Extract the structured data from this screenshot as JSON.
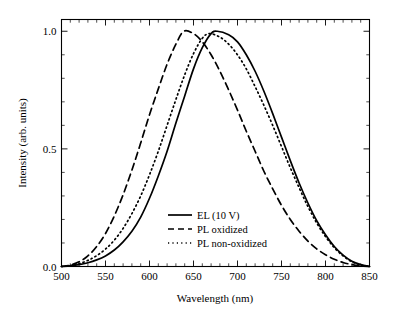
{
  "chart_data": {
    "type": "line",
    "title": "",
    "xlabel": "Wavelength (nm)",
    "ylabel": "Intensity (arb. units)",
    "xlim": [
      500,
      850
    ],
    "ylim": [
      0.0,
      1.05
    ],
    "xticks": [
      500,
      550,
      600,
      650,
      700,
      750,
      800,
      850
    ],
    "xtick_labels": [
      "500",
      "550",
      "600",
      "650",
      "700",
      "750",
      "800",
      "850"
    ],
    "x_minor_step": 10,
    "yticks": [
      0.0,
      0.5,
      1.0
    ],
    "ytick_labels": [
      "0.0",
      "0.5",
      "1.0"
    ],
    "y_minor_step": 0.1,
    "grid": false,
    "legend_position": "center",
    "tick_direction": "in",
    "frame": "box",
    "series": [
      {
        "name": "EL (10 V)",
        "style": "solid",
        "color": "#000000",
        "peak_x": 677,
        "peak_y": 1.0,
        "x": [
          500,
          510,
          520,
          530,
          540,
          550,
          560,
          570,
          580,
          590,
          600,
          610,
          620,
          630,
          640,
          650,
          660,
          670,
          677,
          690,
          700,
          710,
          720,
          730,
          740,
          750,
          760,
          770,
          780,
          790,
          800,
          810,
          820,
          830,
          840,
          850
        ],
        "values": [
          0.0,
          0.003,
          0.008,
          0.016,
          0.028,
          0.045,
          0.07,
          0.105,
          0.15,
          0.21,
          0.29,
          0.385,
          0.49,
          0.61,
          0.725,
          0.84,
          0.93,
          0.99,
          1.0,
          0.985,
          0.955,
          0.9,
          0.83,
          0.745,
          0.65,
          0.55,
          0.45,
          0.355,
          0.27,
          0.195,
          0.135,
          0.085,
          0.048,
          0.022,
          0.008,
          0.0
        ]
      },
      {
        "name": "PL oxidized",
        "style": "dashed",
        "color": "#000000",
        "peak_x": 639,
        "peak_y": 1.0,
        "x": [
          500,
          510,
          520,
          530,
          540,
          550,
          560,
          570,
          580,
          590,
          600,
          610,
          620,
          630,
          639,
          650,
          660,
          670,
          680,
          690,
          700,
          710,
          720,
          730,
          740,
          750,
          760,
          770,
          780,
          790,
          800,
          810,
          820,
          830,
          840,
          850
        ],
        "values": [
          0.0,
          0.006,
          0.02,
          0.045,
          0.085,
          0.14,
          0.215,
          0.305,
          0.41,
          0.525,
          0.645,
          0.755,
          0.86,
          0.945,
          1.0,
          0.99,
          0.955,
          0.9,
          0.83,
          0.75,
          0.665,
          0.575,
          0.49,
          0.405,
          0.33,
          0.26,
          0.2,
          0.15,
          0.108,
          0.075,
          0.05,
          0.031,
          0.017,
          0.008,
          0.002,
          0.0
        ]
      },
      {
        "name": "PL non-oxidized",
        "style": "dotted",
        "color": "#000000",
        "peak_x": 668,
        "peak_y": 0.99,
        "x": [
          500,
          510,
          520,
          530,
          540,
          550,
          560,
          570,
          580,
          590,
          600,
          610,
          620,
          630,
          640,
          650,
          660,
          668,
          680,
          690,
          700,
          710,
          720,
          730,
          740,
          750,
          760,
          770,
          780,
          790,
          800,
          810,
          820,
          830,
          840,
          850
        ],
        "values": [
          0.0,
          0.004,
          0.012,
          0.026,
          0.046,
          0.074,
          0.112,
          0.162,
          0.225,
          0.3,
          0.39,
          0.49,
          0.6,
          0.71,
          0.815,
          0.905,
          0.97,
          0.99,
          0.975,
          0.945,
          0.9,
          0.84,
          0.765,
          0.685,
          0.6,
          0.51,
          0.42,
          0.335,
          0.255,
          0.185,
          0.127,
          0.08,
          0.045,
          0.02,
          0.007,
          0.0
        ]
      }
    ]
  }
}
